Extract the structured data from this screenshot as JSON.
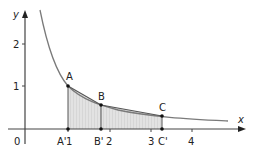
{
  "diagram": {
    "axes": {
      "x_label": "x",
      "y_label": "y",
      "origin_label": "0",
      "x_ticks": [
        "1",
        "2",
        "3",
        "4"
      ],
      "y_ticks": [
        "1",
        "2"
      ]
    },
    "curve": {
      "equation": "y = 1/x",
      "color": "#7a7a7a"
    },
    "points": [
      {
        "label": "A",
        "x": 1.0,
        "y": 1.0
      },
      {
        "label": "B",
        "x": 1.8,
        "y": 0.556
      },
      {
        "label": "C",
        "x": 3.25,
        "y": 0.308
      }
    ],
    "foot_points": [
      {
        "label": "A'",
        "x": 1.0
      },
      {
        "label": "B'",
        "x": 1.8
      },
      {
        "label": "C'",
        "x": 3.25
      }
    ],
    "shading_color": "#dcdcdc",
    "chord_color": "#555555"
  }
}
